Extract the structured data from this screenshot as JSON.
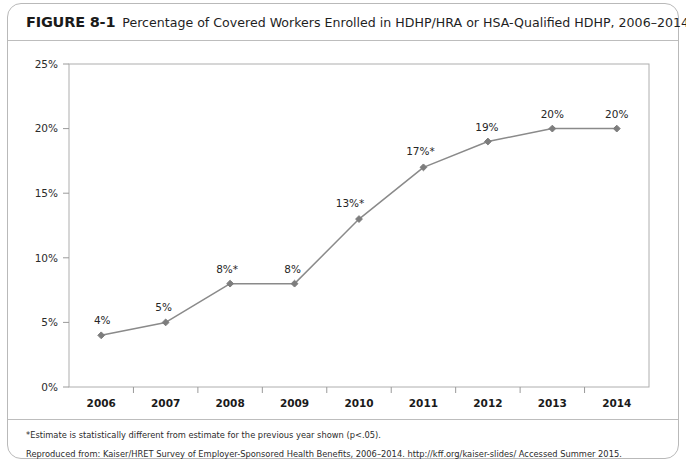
{
  "figure": {
    "label": "FIGURE 8-1",
    "title": "Percentage of Covered Workers Enrolled in HDHP/HRA or HSA-Qualified HDHP, 2006–2014"
  },
  "footer": {
    "note_asterisk": "*Estimate is statistically different from estimate for the previous year shown (p<.05).",
    "source": "Reproduced from:  Kaiser/HRET Survey of Employer-Sponsored Health Benefits, 2006–2014. http://kff.org/kaiser-slides/ Accessed Summer 2015."
  },
  "colors": {
    "line": "#8a8a8a",
    "marker": "#7d7d7d",
    "axis": "#9a9a9a",
    "plot_border": "#aeaeae",
    "card_border": "#b9b9b9",
    "text": "#1f1f1f"
  },
  "chart_data": {
    "type": "line",
    "title": "Percentage of Covered Workers Enrolled in HDHP/HRA or HSA-Qualified HDHP, 2006–2014",
    "xlabel": "",
    "ylabel": "",
    "categories": [
      "2006",
      "2007",
      "2008",
      "2009",
      "2010",
      "2011",
      "2012",
      "2013",
      "2014"
    ],
    "values": [
      4,
      5,
      8,
      8,
      13,
      17,
      19,
      20,
      20
    ],
    "point_labels": [
      "4%",
      "5%",
      "8%*",
      "8%",
      "13%*",
      "17%*",
      "19%",
      "20%",
      "20%"
    ],
    "significant_years": [
      "2008",
      "2010",
      "2011"
    ],
    "ylim": [
      0,
      25
    ],
    "ytick_values": [
      0,
      5,
      10,
      15,
      20,
      25
    ],
    "ytick_labels": [
      "0%",
      "5%",
      "10%",
      "15%",
      "20%",
      "25%"
    ],
    "grid": false,
    "legend": null,
    "series": [
      {
        "name": "Percentage of covered workers enrolled in HDHP/HRA or HSA-qualified HDHP",
        "values": [
          4,
          5,
          8,
          8,
          13,
          17,
          19,
          20,
          20
        ]
      }
    ]
  }
}
